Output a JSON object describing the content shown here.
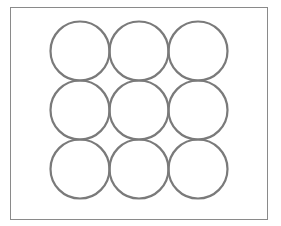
{
  "diagram": {
    "background": "#ffffff",
    "frame": {
      "x": 10.5,
      "y": 7.5,
      "width": 257,
      "height": 212,
      "stroke": "#8a8a8a",
      "stroke_width": 1
    },
    "circle_style": {
      "stroke": "#7a7a7a",
      "stroke_width": 2.2,
      "fill": "none"
    },
    "grid": {
      "rows": 3,
      "cols": 3,
      "radius": 29.5,
      "centers_x": [
        80,
        139,
        198
      ],
      "centers_y": [
        51,
        110,
        169
      ]
    }
  }
}
